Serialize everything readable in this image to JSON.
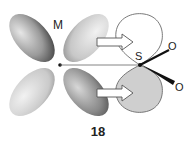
{
  "figure": {
    "label": "18",
    "metal_label": "M",
    "sulfur_label": "S",
    "oxygen_labels": [
      "O",
      "O"
    ],
    "colors": {
      "metal_lobe_dark": "#4a4a4a",
      "metal_lobe_light": "#d8d8d8",
      "s_lobe_filled": "#cfcfcf",
      "s_lobe_empty": "#ffffff",
      "outline": "#666666",
      "arrow_fill": "#ffffff"
    }
  }
}
